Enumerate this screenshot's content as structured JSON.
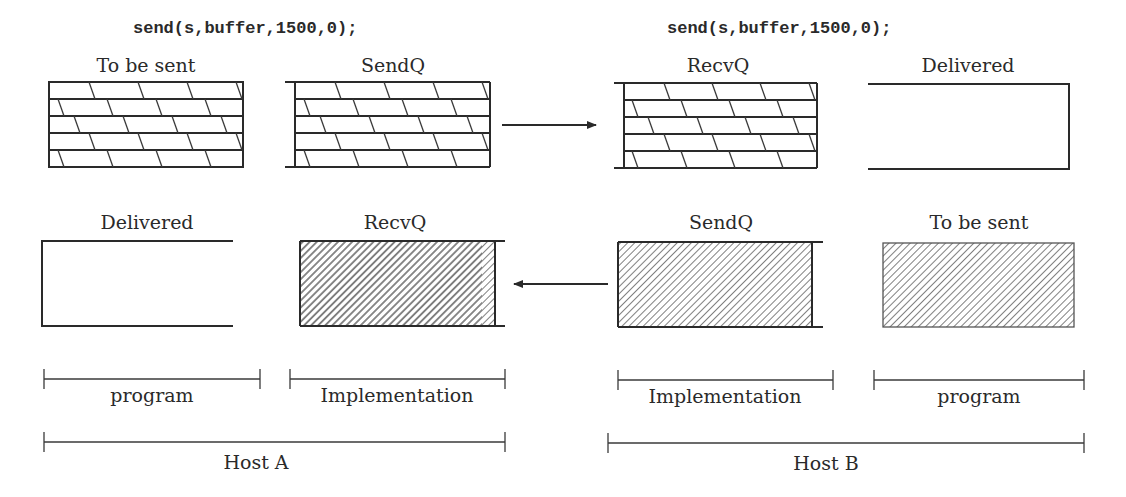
{
  "code_calls": {
    "host_a": "send(s,buffer,1500,0);",
    "host_b": "send(s,buffer,1500,0);"
  },
  "host_a": {
    "label": "Host A",
    "top_row": {
      "to_be_sent": "To be sent",
      "sendq": "SendQ"
    },
    "bottom_row": {
      "delivered": "Delivered",
      "recvq": "RecvQ"
    },
    "brackets": {
      "program": "program",
      "implementation": "Implementation"
    }
  },
  "host_b": {
    "label": "Host B",
    "top_row": {
      "recvq": "RecvQ",
      "delivered": "Delivered"
    },
    "bottom_row": {
      "sendq": "SendQ",
      "to_be_sent": "To be sent"
    },
    "brackets": {
      "implementation": "Implementation",
      "program": "program"
    }
  },
  "arrows": {
    "top": "right",
    "bottom": "left"
  },
  "colors": {
    "ink": "#2a2a2a",
    "background": "#ffffff"
  }
}
